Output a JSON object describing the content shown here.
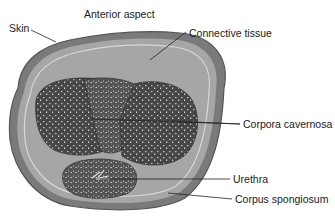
{
  "figure": {
    "title": "Anterior aspect",
    "labels": {
      "skin": "Skin",
      "connective_tissue": "Connective tissue",
      "corpora_cavernosa": "Corpora cavernosa",
      "urethra": "Urethra",
      "corpus_spongiosum": "Corpus spongiosum"
    },
    "colors": {
      "background": "#ffffff",
      "skin_outer": "#6e6e6e",
      "connective": "#a8a8a8",
      "cavernosa": "#4a4a4a",
      "leader_line": "#222222"
    }
  }
}
